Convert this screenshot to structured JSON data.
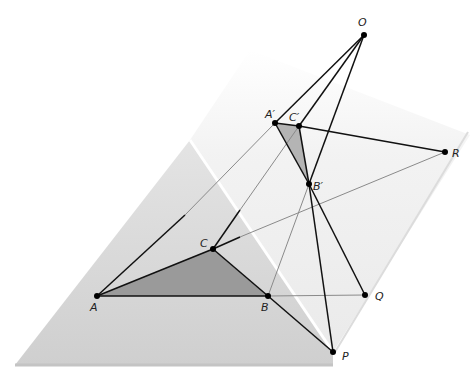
{
  "diagram": {
    "points": {
      "O": {
        "label": "O",
        "x": 364,
        "y": 35,
        "lx": 358,
        "ly": 26
      },
      "A1": {
        "label": "A′",
        "x": 275,
        "y": 123,
        "lx": 265,
        "ly": 118
      },
      "C1": {
        "label": "C′",
        "x": 299,
        "y": 126,
        "lx": 289,
        "ly": 121
      },
      "B1": {
        "label": "B′",
        "x": 309,
        "y": 184,
        "lx": 313,
        "ly": 190
      },
      "R": {
        "label": "R",
        "x": 445,
        "y": 152,
        "lx": 452,
        "ly": 157
      },
      "A": {
        "label": "A",
        "x": 97,
        "y": 296,
        "lx": 90,
        "ly": 311
      },
      "C": {
        "label": "C",
        "x": 213,
        "y": 249,
        "lx": 200,
        "ly": 247
      },
      "B": {
        "label": "B",
        "x": 268,
        "y": 296,
        "lx": 261,
        "ly": 311
      },
      "Q": {
        "label": "Q",
        "x": 365,
        "y": 295,
        "lx": 375,
        "ly": 300
      },
      "P": {
        "label": "P",
        "x": 333,
        "y": 352,
        "lx": 342,
        "ly": 360
      }
    },
    "colors": {
      "lower_plane": "#d2d2d2",
      "upper_plane": "#ececec",
      "triangle_fill": "#9a9a9a",
      "line": "#111111",
      "hidden_line": "#888888"
    }
  }
}
